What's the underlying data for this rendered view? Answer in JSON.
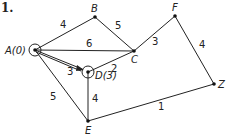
{
  "problem_number": "1.",
  "nodes": {
    "A": {
      "label": "A(0)",
      "x": 35,
      "y": 50
    },
    "B": {
      "label": "B",
      "x": 95,
      "y": 17
    },
    "C": {
      "label": "C",
      "x": 134,
      "y": 51
    },
    "D": {
      "label": "D(3)",
      "x": 88,
      "y": 72
    },
    "E": {
      "label": "E",
      "x": 88,
      "y": 121
    },
    "F": {
      "label": "F",
      "x": 175,
      "y": 16
    },
    "Z": {
      "label": "Z",
      "x": 214,
      "y": 84
    }
  },
  "edges": [
    {
      "from": "A",
      "to": "B",
      "weight": "4"
    },
    {
      "from": "B",
      "to": "C",
      "weight": "5"
    },
    {
      "from": "A",
      "to": "C",
      "weight": "6"
    },
    {
      "from": "C",
      "to": "F",
      "weight": "3"
    },
    {
      "from": "F",
      "to": "Z",
      "weight": "4"
    },
    {
      "from": "A",
      "to": "D",
      "weight": "3"
    },
    {
      "from": "D",
      "to": "C",
      "weight": "2"
    },
    {
      "from": "A",
      "to": "E",
      "weight": "5"
    },
    {
      "from": "D",
      "to": "E",
      "weight": "4"
    },
    {
      "from": "E",
      "to": "Z",
      "weight": "1"
    }
  ]
}
